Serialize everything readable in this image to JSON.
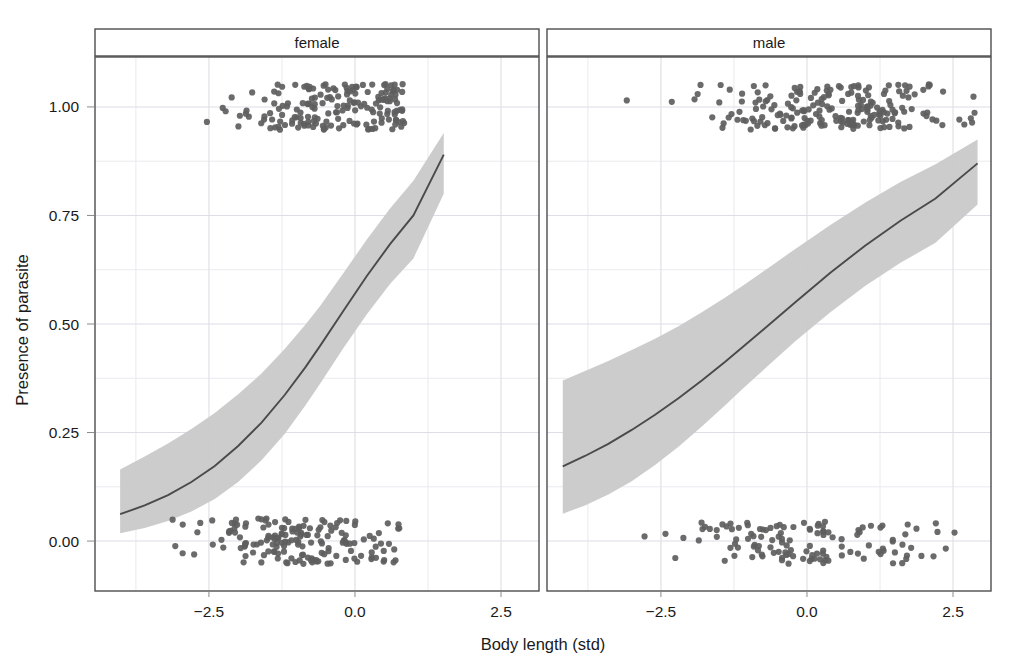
{
  "figure": {
    "background": "#ffffff",
    "panel_border_color": "#4d4d4d",
    "grid_color": "#e8e8ee",
    "point_color": "#5e5e5e",
    "line_color": "#4a4a4a",
    "ribbon_color": "#c9c9c9",
    "strip_background": "#ffffff"
  },
  "chart_data": {
    "type": "scatter",
    "title": "",
    "subtitle": "",
    "xlabel": "Body length (std)",
    "ylabel": "Presence of parasite",
    "xlim": [
      -4.45,
      3.15
    ],
    "ylim": [
      -0.115,
      1.115
    ],
    "xticks": [
      -2.5,
      0.0,
      2.5
    ],
    "xtick_labels": [
      "−2.5",
      "0.0",
      "2.5"
    ],
    "yticks": [
      0.0,
      0.25,
      0.5,
      0.75,
      1.0
    ],
    "ytick_labels": [
      "0.00",
      "0.25",
      "0.50",
      "0.75",
      "1.00"
    ],
    "grid": true,
    "grid_minor": true,
    "legend": "none",
    "facet_variable": "sex",
    "facets": [
      {
        "label": "female",
        "description": "Logistic fit of parasite presence on standardized body length for females; steep sigmoid rising from about 0.06 at x=-4 to about 0.89 at x=1.5.",
        "fit": {
          "type": "logistic",
          "intercept": 0.62,
          "slope": 0.73,
          "x_range": [
            -4.02,
            1.52
          ],
          "x50_crossing": -0.85,
          "y_at_xmin": 0.06,
          "y_at_xmax": 0.89,
          "curve": [
            {
              "x": -4.02,
              "y": 0.062,
              "lo": 0.018,
              "hi": 0.165
            },
            {
              "x": -3.6,
              "y": 0.082,
              "lo": 0.03,
              "hi": 0.195
            },
            {
              "x": -3.2,
              "y": 0.106,
              "lo": 0.046,
              "hi": 0.225
            },
            {
              "x": -2.8,
              "y": 0.136,
              "lo": 0.068,
              "hi": 0.258
            },
            {
              "x": -2.4,
              "y": 0.173,
              "lo": 0.097,
              "hi": 0.295
            },
            {
              "x": -2.0,
              "y": 0.219,
              "lo": 0.136,
              "hi": 0.338
            },
            {
              "x": -1.6,
              "y": 0.273,
              "lo": 0.186,
              "hi": 0.386
            },
            {
              "x": -1.2,
              "y": 0.337,
              "lo": 0.247,
              "hi": 0.443
            },
            {
              "x": -0.85,
              "y": 0.4,
              "lo": 0.312,
              "hi": 0.498
            },
            {
              "x": -0.6,
              "y": 0.449,
              "lo": 0.362,
              "hi": 0.541
            },
            {
              "x": -0.2,
              "y": 0.53,
              "lo": 0.444,
              "hi": 0.617
            },
            {
              "x": 0.2,
              "y": 0.61,
              "lo": 0.522,
              "hi": 0.694
            },
            {
              "x": 0.6,
              "y": 0.684,
              "lo": 0.592,
              "hi": 0.766
            },
            {
              "x": 1.0,
              "y": 0.75,
              "lo": 0.651,
              "hi": 0.83
            },
            {
              "x": 1.52,
              "y": 0.89,
              "lo": 0.8,
              "hi": 0.94
            }
          ]
        },
        "points_note": "Raw binary observations jittered around y = 0 and y = 1.",
        "n_points_approx": 340,
        "x_min_observed": -4.0,
        "x_max_observed": 0.85
      },
      {
        "label": "male",
        "description": "Logistic fit of parasite presence on standardized body length for males; shallower sigmoid rising from about 0.17 at x=-4.2 to about 0.87 at x=2.9.",
        "fit": {
          "type": "logistic",
          "intercept": 0.4,
          "slope": 0.44,
          "x_range": [
            -4.18,
            2.92
          ],
          "x50_crossing": -1.1,
          "y_at_xmin": 0.17,
          "y_at_xmax": 0.87,
          "curve": [
            {
              "x": -4.18,
              "y": 0.172,
              "lo": 0.063,
              "hi": 0.37
            },
            {
              "x": -3.8,
              "y": 0.196,
              "lo": 0.082,
              "hi": 0.392
            },
            {
              "x": -3.4,
              "y": 0.224,
              "lo": 0.107,
              "hi": 0.415
            },
            {
              "x": -3.0,
              "y": 0.256,
              "lo": 0.138,
              "hi": 0.44
            },
            {
              "x": -2.6,
              "y": 0.291,
              "lo": 0.175,
              "hi": 0.466
            },
            {
              "x": -2.2,
              "y": 0.329,
              "lo": 0.217,
              "hi": 0.495
            },
            {
              "x": -1.8,
              "y": 0.37,
              "lo": 0.264,
              "hi": 0.527
            },
            {
              "x": -1.4,
              "y": 0.413,
              "lo": 0.313,
              "hi": 0.561
            },
            {
              "x": -1.1,
              "y": 0.447,
              "lo": 0.351,
              "hi": 0.588
            },
            {
              "x": -0.6,
              "y": 0.504,
              "lo": 0.412,
              "hi": 0.635
            },
            {
              "x": -0.2,
              "y": 0.55,
              "lo": 0.46,
              "hi": 0.673
            },
            {
              "x": 0.4,
              "y": 0.618,
              "lo": 0.527,
              "hi": 0.728
            },
            {
              "x": 1.0,
              "y": 0.681,
              "lo": 0.588,
              "hi": 0.78
            },
            {
              "x": 1.6,
              "y": 0.738,
              "lo": 0.641,
              "hi": 0.827
            },
            {
              "x": 2.2,
              "y": 0.789,
              "lo": 0.687,
              "hi": 0.868
            },
            {
              "x": 2.92,
              "y": 0.87,
              "lo": 0.775,
              "hi": 0.925
            }
          ]
        },
        "points_note": "Raw binary observations jittered around y = 0 and y = 1.",
        "n_points_approx": 330,
        "x_min_observed": -4.1,
        "x_max_observed": 2.9
      }
    ]
  }
}
